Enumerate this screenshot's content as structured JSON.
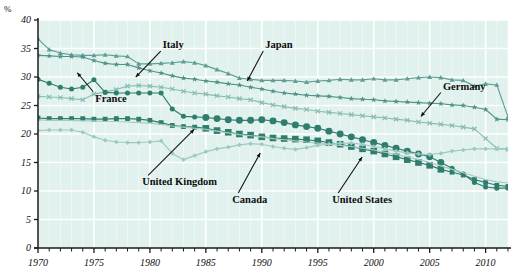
{
  "figure": {
    "unit_label": "%",
    "background": "#e3f2ef",
    "plot_bg": "#e0f1ee",
    "gridline_color": "#ffffff",
    "axis_color": "#1a1a1a"
  },
  "chart_data": {
    "type": "line",
    "title": "",
    "subtitle": "",
    "xlabel": "",
    "ylabel": "%",
    "xlim": [
      1970,
      2012
    ],
    "ylim": [
      0,
      40
    ],
    "yticks": [
      0,
      5,
      10,
      15,
      20,
      25,
      30,
      35,
      40
    ],
    "ytick_labels": [
      "0",
      "5",
      "10",
      "15",
      "20",
      "25",
      "30",
      "35",
      "40"
    ],
    "xticks": [
      1970,
      1975,
      1980,
      1985,
      1990,
      1995,
      2000,
      2005,
      2010
    ],
    "xtick_labels": [
      "1970",
      "1975",
      "1980",
      "1985",
      "1990",
      "1995",
      "2000",
      "2005",
      "2010"
    ],
    "xtick_minor_step": 1,
    "grid": true,
    "legend_position": "inline-annotations",
    "x": [
      1970,
      1971,
      1972,
      1973,
      1974,
      1975,
      1976,
      1977,
      1978,
      1979,
      1980,
      1981,
      1982,
      1983,
      1984,
      1985,
      1986,
      1987,
      1988,
      1989,
      1990,
      1991,
      1992,
      1993,
      1994,
      1995,
      1996,
      1997,
      1998,
      1999,
      2000,
      2001,
      2002,
      2003,
      2004,
      2005,
      2006,
      2007,
      2008,
      2009,
      2010,
      2011,
      2012
    ],
    "series": [
      {
        "name": "Italy",
        "marker": "triangle",
        "color": "#5f9e94",
        "values": [
          36.7,
          34.8,
          34.2,
          33.9,
          33.8,
          33.8,
          33.9,
          33.7,
          33.6,
          32.3,
          32.3,
          32.4,
          32.5,
          32.7,
          32.5,
          32.0,
          31.3,
          30.6,
          29.8,
          29.6,
          29.4,
          29.4,
          29.4,
          29.3,
          29.1,
          29.3,
          29.4,
          29.6,
          29.5,
          29.5,
          29.7,
          29.5,
          29.5,
          29.7,
          29.9,
          30.0,
          29.9,
          29.5,
          29.4,
          28.4,
          28.8,
          28.6,
          23.0
        ]
      },
      {
        "name": "Germany",
        "marker": "star",
        "color": "#4f9489",
        "values": [
          33.8,
          33.7,
          33.6,
          33.6,
          33.5,
          32.9,
          32.4,
          32.2,
          32.2,
          31.6,
          31.1,
          30.7,
          30.2,
          29.8,
          29.6,
          29.3,
          29.1,
          28.8,
          28.6,
          28.2,
          27.9,
          27.5,
          27.2,
          27.0,
          26.8,
          26.7,
          26.6,
          26.4,
          26.2,
          26.1,
          26.0,
          25.8,
          25.7,
          25.6,
          25.5,
          25.4,
          25.3,
          25.1,
          25.0,
          24.7,
          24.3,
          22.6,
          22.5
        ]
      },
      {
        "name": "Japan",
        "marker": "x",
        "color": "#89bdb4",
        "values": [
          26.6,
          26.5,
          26.4,
          26.2,
          26.0,
          27.0,
          27.4,
          27.8,
          28.4,
          28.5,
          28.4,
          28.2,
          27.9,
          27.5,
          27.2,
          27.0,
          26.7,
          26.5,
          26.2,
          26.0,
          25.5,
          25.1,
          24.8,
          24.5,
          24.3,
          24.0,
          23.8,
          23.6,
          23.4,
          23.2,
          23.0,
          22.8,
          22.6,
          22.4,
          22.1,
          21.9,
          21.7,
          21.5,
          21.2,
          20.9,
          19.2,
          17.5,
          17.3
        ]
      },
      {
        "name": "Canada",
        "marker": "circle",
        "color": "#2f7d6d",
        "values": [
          29.6,
          28.9,
          28.2,
          27.9,
          28.2,
          29.5,
          27.3,
          27.2,
          27.2,
          27.2,
          27.2,
          27.2,
          24.4,
          23.1,
          23.0,
          22.9,
          22.7,
          22.5,
          22.4,
          22.4,
          22.5,
          22.3,
          22.0,
          21.6,
          21.3,
          21.0,
          20.5,
          20.0,
          19.5,
          19.0,
          18.5,
          18.0,
          17.5,
          17.0,
          16.5,
          16.0,
          15.0,
          14.0,
          13.0,
          11.5,
          10.7,
          10.5,
          10.5
        ]
      },
      {
        "name": "France",
        "marker": "square",
        "color": "#2f7d6d",
        "values": [
          22.8,
          22.7,
          22.7,
          22.7,
          22.7,
          22.6,
          22.6,
          22.7,
          22.7,
          22.6,
          22.4,
          22.0,
          21.5,
          21.3,
          21.2,
          21.0,
          20.6,
          20.3,
          20.0,
          19.8,
          19.5,
          19.3,
          19.2,
          19.1,
          19.0,
          18.8,
          18.5,
          18.2,
          17.8,
          17.4,
          17.0,
          16.5,
          16.0,
          15.5,
          15.0,
          14.5,
          13.8,
          13.3,
          12.8,
          12.0,
          11.5,
          11.0,
          10.8
        ]
      },
      {
        "name": "United Kingdom",
        "marker": "diamond",
        "color": "#9dc9c2",
        "values": [
          20.6,
          20.7,
          20.7,
          20.7,
          20.3,
          19.5,
          18.9,
          18.6,
          18.5,
          18.5,
          18.6,
          18.8,
          16.6,
          15.5,
          16.2,
          16.9,
          17.4,
          17.7,
          18.1,
          18.3,
          18.2,
          17.8,
          17.5,
          17.3,
          17.6,
          18.0,
          18.2,
          18.4,
          18.4,
          18.2,
          17.8,
          17.4,
          17.0,
          16.7,
          16.5,
          16.4,
          16.6,
          17.0,
          17.2,
          17.4,
          17.4,
          17.4,
          17.3
        ]
      },
      {
        "name": "United States",
        "marker": "none",
        "color": "#a9c9c2",
        "values": [
          22.5,
          22.4,
          22.4,
          22.4,
          22.3,
          22.3,
          22.2,
          22.2,
          22.1,
          22.0,
          21.9,
          21.7,
          21.4,
          21.2,
          21.0,
          20.8,
          20.5,
          20.2,
          19.9,
          19.7,
          19.5,
          19.2,
          19.0,
          18.8,
          18.6,
          18.4,
          18.2,
          18.0,
          17.8,
          17.5,
          17.2,
          16.8,
          16.4,
          16.0,
          15.5,
          15.0,
          14.4,
          13.8,
          13.2,
          12.6,
          12.0,
          11.6,
          11.4
        ]
      }
    ]
  },
  "annotations": [
    {
      "label": "Italy",
      "x_pct": 31.6,
      "y_pct": 17.3,
      "arrow_dx": -25,
      "arrow_dy": 26
    },
    {
      "label": "Japan",
      "x_pct": 51.5,
      "y_pct": 17.3,
      "arrow_dx": -16,
      "arrow_dy": 30
    },
    {
      "label": "Germany",
      "x_pct": 86.0,
      "y_pct": 32.2,
      "arrow_dx": -20,
      "arrow_dy": 24
    },
    {
      "label": "France",
      "x_pct": 18.5,
      "y_pct": 36.6,
      "arrow_dx": -16,
      "arrow_dy": -19
    },
    {
      "label": "United Kingdom",
      "x_pct": 27.6,
      "y_pct": 66.7,
      "arrow_dx": 46,
      "arrow_dy": -46
    },
    {
      "label": "Canada",
      "x_pct": 45.1,
      "y_pct": 73.0,
      "arrow_dx": 22,
      "arrow_dy": -40
    },
    {
      "label": "United States",
      "x_pct": 64.5,
      "y_pct": 73.0,
      "arrow_dx": 24,
      "arrow_dy": -36
    }
  ]
}
